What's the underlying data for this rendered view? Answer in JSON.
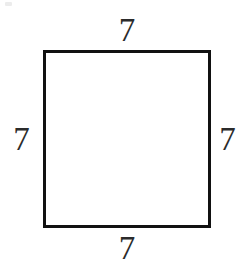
{
  "figure": {
    "type": "square",
    "shape_name": "square",
    "stroke_color": "#111111",
    "fill_color": "#ffffff",
    "background_color": "#ffffff",
    "label_color": "#2b2b2b",
    "side_unit": "",
    "labels": {
      "top": "7",
      "right": "7",
      "bottom": "7",
      "left": "7"
    }
  },
  "chart_data": {
    "type": "diagram",
    "title": "",
    "shape": "square",
    "side_labels": [
      "7",
      "7",
      "7",
      "7"
    ],
    "side_label_positions": [
      "top",
      "right",
      "bottom",
      "left"
    ],
    "side_length": 7,
    "values": [
      7,
      7,
      7,
      7
    ],
    "categories": [
      "top",
      "right",
      "bottom",
      "left"
    ]
  }
}
